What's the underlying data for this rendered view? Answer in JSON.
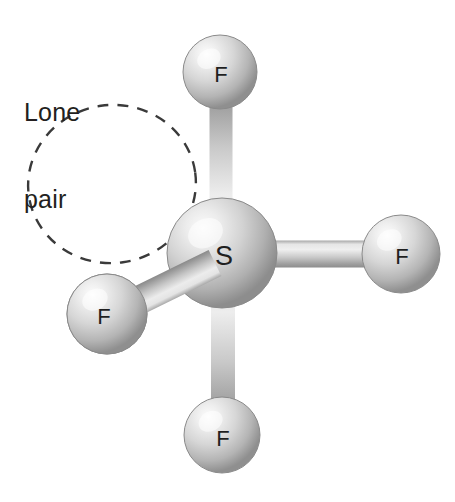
{
  "figure": {
    "type": "molecular-structure-diagram",
    "background_color": "#ffffff",
    "annotation": {
      "line1": "Lone",
      "line2": "pair",
      "text_color": "#231f20",
      "x": 24,
      "y": 40
    },
    "lone_pair_lobe": {
      "name": "lone-pair-lobe",
      "shape": "dashed-ellipse",
      "cx": 112,
      "cy": 184,
      "rx": 84,
      "ry": 79,
      "rotation": -8,
      "stroke_color": "#3a3a3a",
      "stroke_width": 2.4,
      "dash_pattern": "11 9"
    },
    "atoms": [
      {
        "id": "s-center",
        "element": "S",
        "label": "S",
        "cx": 222,
        "cy": 253,
        "r": 55,
        "label_x": 224,
        "label_y": 258,
        "font_size": 27,
        "color": "#c9c9c9",
        "highlight_color": "#f4f4f4",
        "shadow_color": "#8c8c8c"
      },
      {
        "id": "f-top",
        "element": "F",
        "label": "F",
        "cx": 220,
        "cy": 72,
        "r": 37,
        "label_x": 221,
        "label_y": 76,
        "font_size": 22,
        "color": "#cfcfcf",
        "highlight_color": "#f6f6f6",
        "shadow_color": "#909090"
      },
      {
        "id": "f-right",
        "element": "F",
        "label": "F",
        "cx": 401,
        "cy": 254,
        "r": 39,
        "label_x": 402,
        "label_y": 258,
        "font_size": 22,
        "color": "#cfcfcf",
        "highlight_color": "#f6f6f6",
        "shadow_color": "#909090"
      },
      {
        "id": "f-bottom",
        "element": "F",
        "label": "F",
        "cx": 222,
        "cy": 435,
        "r": 38,
        "label_x": 223,
        "label_y": 440,
        "font_size": 22,
        "color": "#cfcfcf",
        "highlight_color": "#f6f6f6",
        "shadow_color": "#909090"
      },
      {
        "id": "f-lower-left",
        "element": "F",
        "label": "F",
        "cx": 107,
        "cy": 314,
        "r": 40,
        "label_x": 104,
        "label_y": 318,
        "font_size": 22,
        "color": "#cfcfcf",
        "highlight_color": "#f6f6f6",
        "shadow_color": "#909090"
      }
    ],
    "bonds": [
      {
        "id": "bond-s-f-top",
        "from": "s-center",
        "to": "f-top",
        "x1": 221,
        "y1": 253,
        "x2": 221,
        "y2": 82,
        "width": 23,
        "light_color": "#ededed",
        "mid_color": "#c6c6c6",
        "dark_color": "#8f8f8f"
      },
      {
        "id": "bond-s-f-bottom",
        "from": "s-center",
        "to": "f-bottom",
        "x1": 223,
        "y1": 253,
        "x2": 223,
        "y2": 428,
        "width": 24,
        "light_color": "#ededed",
        "mid_color": "#c6c6c6",
        "dark_color": "#8f8f8f"
      },
      {
        "id": "bond-s-f-right",
        "from": "s-center",
        "to": "f-right",
        "x1": 222,
        "y1": 254,
        "x2": 396,
        "y2": 254,
        "width": 27,
        "light_color": "#efefef",
        "mid_color": "#c6c6c6",
        "dark_color": "#8d8d8d"
      },
      {
        "id": "bond-s-f-lower-left",
        "from": "s-center",
        "to": "f-lower-left",
        "x1": 215,
        "y1": 263,
        "x2": 115,
        "y2": 312,
        "width": 29,
        "light_color": "#ededed",
        "mid_color": "#c2c2c2",
        "dark_color": "#8a8a8a"
      }
    ]
  }
}
